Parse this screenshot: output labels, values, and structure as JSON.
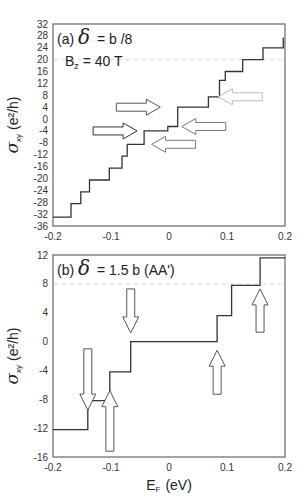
{
  "chart_data": [
    {
      "type": "line",
      "panel": "(a)",
      "title_prefix": "(a)",
      "delta_symbol": "δ",
      "title_text": "= b  /8",
      "annotation": "B_z = 40 T",
      "annotation_main": "B",
      "annotation_sub": "z",
      "annotation_rest": " = 40 T",
      "xlabel": "",
      "ylabel_main": "σ",
      "ylabel_sub": "xy",
      "ylabel_unit": "(e²/h)",
      "xlim": [
        -0.2,
        0.2
      ],
      "ylim": [
        -36,
        32
      ],
      "xticks": [
        "-0.2",
        "-0.1",
        "0",
        "0.1",
        "0.2"
      ],
      "yticks": [
        "32",
        "28",
        "24",
        "20",
        "16",
        "12",
        "8",
        "4",
        "0",
        "-4",
        "-8",
        "-12",
        "-16",
        "-20",
        "-24",
        "-28",
        "-32",
        "-36"
      ],
      "gridline_dashed_y": 20,
      "series": [
        {
          "name": "sigma_xy staircase",
          "x": [
            -0.2,
            -0.169,
            -0.169,
            -0.152,
            -0.152,
            -0.137,
            -0.137,
            -0.103,
            -0.103,
            -0.081,
            -0.081,
            -0.072,
            -0.072,
            -0.043,
            -0.043,
            -0.002,
            -0.002,
            0.015,
            0.015,
            0.068,
            0.068,
            0.087,
            0.087,
            0.097,
            0.097,
            0.127,
            0.127,
            0.162,
            0.162,
            0.197,
            0.197
          ],
          "y": [
            -33,
            -33,
            -28.5,
            -28.5,
            -24.5,
            -24.5,
            -20.5,
            -20.5,
            -16.5,
            -16.5,
            -12.5,
            -12.5,
            -8.5,
            -8.5,
            -4,
            -4,
            -2.5,
            -2.5,
            4,
            4,
            7.5,
            7.5,
            13,
            13,
            16,
            16,
            20,
            20,
            24,
            24,
            27.5,
            27.5,
            31.5
          ]
        }
      ],
      "arrows": [
        {
          "direction": "right",
          "x": -0.015,
          "y": 4,
          "color": "#555555"
        },
        {
          "direction": "right",
          "x": -0.055,
          "y": -4,
          "color": "#333333"
        },
        {
          "direction": "left",
          "x": 0.022,
          "y": -2.5,
          "color": "#777777"
        },
        {
          "direction": "left",
          "x": -0.03,
          "y": -8.5,
          "color": "#777777"
        },
        {
          "direction": "left",
          "x": 0.085,
          "y": 7.5,
          "color": "#bbbbbb"
        }
      ]
    },
    {
      "type": "line",
      "panel": "(b)",
      "title_prefix": "(b)",
      "delta_symbol": "δ",
      "title_text": "= 1.5 b  (AA')",
      "xlabel_main": "E",
      "xlabel_sub": "F",
      "xlabel_unit": "(eV)",
      "ylabel_main": "σ",
      "ylabel_sub": "xy",
      "ylabel_unit": "(e²/h)",
      "xlim": [
        -0.2,
        0.2
      ],
      "ylim": [
        -16,
        12
      ],
      "xticks": [
        "-0.2",
        "-0.1",
        "0",
        "0.1",
        "0.2"
      ],
      "yticks": [
        "12",
        "8",
        "4",
        "0",
        "-4",
        "-8",
        "-12",
        "-16"
      ],
      "gridline_dashed_y": 8,
      "series": [
        {
          "name": "sigma_xy staircase",
          "x": [
            -0.2,
            -0.14,
            -0.14,
            -0.102,
            -0.102,
            -0.066,
            -0.066,
            0.083,
            0.083,
            0.108,
            0.108,
            0.157,
            0.157,
            0.2
          ],
          "y": [
            -12.2,
            -12.2,
            -8.2,
            -8.2,
            -4.2,
            -4.2,
            0,
            0,
            3.6,
            3.6,
            7.8,
            7.8,
            11.6,
            11.6
          ]
        }
      ],
      "arrows": [
        {
          "direction": "down",
          "x": -0.14,
          "y_top": -1,
          "y_tip": -9.5
        },
        {
          "direction": "up",
          "x": -0.102,
          "y_bottom": -15.2,
          "y_tip": -6.8
        },
        {
          "direction": "down",
          "x": -0.066,
          "y_top": 7.3,
          "y_tip": 1.2
        },
        {
          "direction": "up",
          "x": 0.083,
          "y_bottom": -7.3,
          "y_tip": -1.2
        },
        {
          "direction": "up",
          "x": 0.157,
          "y_bottom": 1.3,
          "y_tip": 7.3
        }
      ]
    }
  ]
}
